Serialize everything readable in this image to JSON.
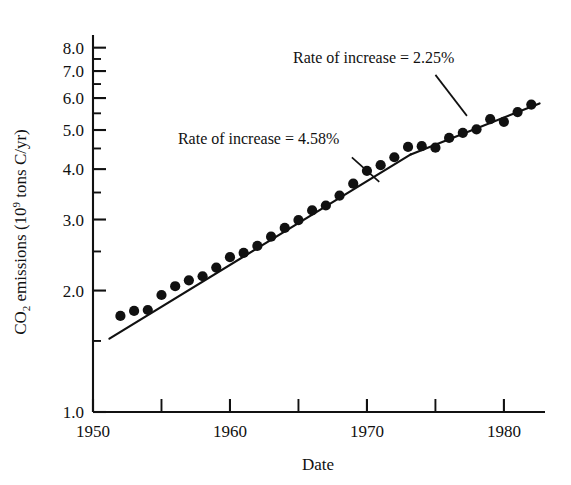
{
  "chart_data": {
    "type": "scatter",
    "title": "",
    "xlabel": "Date",
    "ylabel": "CO2 emissions (10^9 tons C/yr)",
    "ylabel_parts": {
      "prefix": "CO",
      "subscript": "2",
      "middle": " emissions (10",
      "superscript": "9",
      "suffix": " tons C/yr)"
    },
    "yscale": "log",
    "xscale": "linear",
    "xlim": [
      1950,
      1983
    ],
    "ylim": [
      1.0,
      8.6
    ],
    "grid": false,
    "legend": null,
    "xticks": [
      1950,
      1960,
      1970,
      1980
    ],
    "xticklabels": [
      "1950",
      "1960",
      "1970",
      "1980"
    ],
    "xminorticks": [
      1955,
      1965,
      1975
    ],
    "yticks": [
      1.0,
      2.0,
      3.0,
      4.0,
      5.0,
      6.0,
      7.0,
      8.0
    ],
    "yticklabels": [
      "1.0",
      "2.0",
      "3.0",
      "4.0",
      "5.0",
      "6.0",
      "7.0",
      "8.0"
    ],
    "yminorticks": [
      1.5,
      2.5,
      3.5,
      4.5,
      5.5,
      6.5,
      7.5
    ],
    "x": [
      1952,
      1953,
      1954,
      1955,
      1956,
      1957,
      1958,
      1959,
      1960,
      1961,
      1962,
      1963,
      1964,
      1965,
      1966,
      1967,
      1968,
      1969,
      1970,
      1971,
      1972,
      1973,
      1974,
      1975,
      1976,
      1977,
      1978,
      1979,
      1980,
      1981,
      1982
    ],
    "values": [
      1.73,
      1.78,
      1.79,
      1.95,
      2.05,
      2.12,
      2.17,
      2.28,
      2.42,
      2.48,
      2.58,
      2.72,
      2.86,
      2.99,
      3.16,
      3.25,
      3.44,
      3.68,
      3.96,
      4.09,
      4.28,
      4.54,
      4.56,
      4.52,
      4.78,
      4.92,
      5.02,
      5.32,
      5.24,
      5.54,
      5.78
    ],
    "point_marker": "filled-circle",
    "point_color": "#111111",
    "line_color": "#111111",
    "trend_segments": [
      {
        "name": "early-trend",
        "rate_percent": 4.58,
        "x_start": 1951.2,
        "x_end": 1973.2,
        "y_start": 1.52,
        "y_end": 4.35
      },
      {
        "name": "late-trend",
        "rate_percent": 2.25,
        "x_start": 1973.2,
        "x_end": 1982.6,
        "y_start": 4.35,
        "y_end": 5.82
      }
    ],
    "annotations": [
      {
        "name": "rate-4-58",
        "text": "Rate of increase = 4.58%",
        "text_x": 1956.2,
        "text_y": 4.62,
        "leader_from_x": 1968.9,
        "leader_from_y": 4.28,
        "leader_to_x": 1970.9,
        "leader_to_y": 3.72
      },
      {
        "name": "rate-2-25",
        "text": "Rate of increase = 2.25%",
        "text_x": 1964.6,
        "text_y": 7.35,
        "leader_from_x": 1975.0,
        "leader_from_y": 6.85,
        "leader_to_x": 1977.3,
        "leader_to_y": 5.42
      }
    ]
  }
}
